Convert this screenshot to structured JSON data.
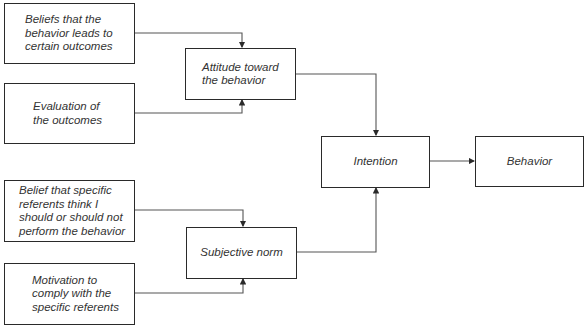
{
  "diagram": {
    "type": "flowchart",
    "nodes": [
      {
        "id": "beliefs_outcomes",
        "label": "Beliefs that the\nbehavior leads to\ncertain outcomes"
      },
      {
        "id": "evaluation",
        "label": "Evaluation of\nthe outcomes"
      },
      {
        "id": "attitude",
        "label": "Attitude toward\nthe behavior"
      },
      {
        "id": "belief_referents",
        "label": "Belief that specific\nreferents think I\nshould or should not\nperform the behavior"
      },
      {
        "id": "motivation",
        "label": "Motivation to\ncomply with the\nspecific referents"
      },
      {
        "id": "subjective_norm",
        "label": "Subjective norm"
      },
      {
        "id": "intention",
        "label": "Intention"
      },
      {
        "id": "behavior",
        "label": "Behavior"
      }
    ],
    "edges": [
      {
        "from": "beliefs_outcomes",
        "to": "attitude"
      },
      {
        "from": "evaluation",
        "to": "attitude"
      },
      {
        "from": "belief_referents",
        "to": "subjective_norm"
      },
      {
        "from": "motivation",
        "to": "subjective_norm"
      },
      {
        "from": "attitude",
        "to": "intention"
      },
      {
        "from": "subjective_norm",
        "to": "intention"
      },
      {
        "from": "intention",
        "to": "behavior"
      }
    ],
    "colors": {
      "stroke": "#2a2a2a",
      "text": "#333333",
      "background": "#ffffff"
    }
  }
}
